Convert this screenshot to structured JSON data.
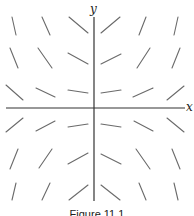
{
  "figure": {
    "caption": "Figure 11.1",
    "x_axis_label": "x",
    "y_axis_label": "y",
    "axis_color": "#333333",
    "segment_color": "#6a6a6a",
    "origin": [
      94,
      108
    ],
    "x_axis": {
      "x1": 6,
      "x2": 185
    },
    "y_axis": {
      "y1": 17,
      "y2": 201
    }
  },
  "chart_data": {
    "type": "direction_field",
    "title": "",
    "xlabel": "x",
    "ylabel": "y",
    "grid": false,
    "caption": "Figure 11.1",
    "grid_points": {
      "x": [
        -3,
        -2,
        -1,
        1,
        2,
        3
      ],
      "y": [
        3,
        2,
        1,
        -1,
        -2,
        -3
      ]
    },
    "segments": [
      {
        "x1": 12,
        "y1": 17,
        "x2": 16,
        "y2": 35
      },
      {
        "x1": 42,
        "y1": 17,
        "x2": 50,
        "y2": 35
      },
      {
        "x1": 69,
        "y1": 17,
        "x2": 88,
        "y2": 33
      },
      {
        "x1": 101,
        "y1": 33,
        "x2": 120,
        "y2": 17
      },
      {
        "x1": 139,
        "y1": 35,
        "x2": 146,
        "y2": 17
      },
      {
        "x1": 174,
        "y1": 35,
        "x2": 178,
        "y2": 17
      },
      {
        "x1": 10,
        "y1": 48,
        "x2": 18,
        "y2": 68
      },
      {
        "x1": 38,
        "y1": 48,
        "x2": 52,
        "y2": 68
      },
      {
        "x1": 68,
        "y1": 53,
        "x2": 88,
        "y2": 64
      },
      {
        "x1": 101,
        "y1": 64,
        "x2": 121,
        "y2": 54
      },
      {
        "x1": 137,
        "y1": 68,
        "x2": 150,
        "y2": 48
      },
      {
        "x1": 172,
        "y1": 68,
        "x2": 180,
        "y2": 48
      },
      {
        "x1": 6,
        "y1": 85,
        "x2": 23,
        "y2": 100
      },
      {
        "x1": 36,
        "y1": 88,
        "x2": 55,
        "y2": 97
      },
      {
        "x1": 68,
        "y1": 90,
        "x2": 88,
        "y2": 93
      },
      {
        "x1": 101,
        "y1": 93,
        "x2": 121,
        "y2": 90
      },
      {
        "x1": 133,
        "y1": 97,
        "x2": 153,
        "y2": 88
      },
      {
        "x1": 167,
        "y1": 100,
        "x2": 184,
        "y2": 86
      },
      {
        "x1": 6,
        "y1": 132,
        "x2": 23,
        "y2": 118
      },
      {
        "x1": 36,
        "y1": 131,
        "x2": 55,
        "y2": 121
      },
      {
        "x1": 68,
        "y1": 127,
        "x2": 88,
        "y2": 124
      },
      {
        "x1": 101,
        "y1": 124,
        "x2": 121,
        "y2": 127
      },
      {
        "x1": 134,
        "y1": 121,
        "x2": 153,
        "y2": 131
      },
      {
        "x1": 167,
        "y1": 118,
        "x2": 184,
        "y2": 132
      },
      {
        "x1": 10,
        "y1": 169,
        "x2": 18,
        "y2": 149
      },
      {
        "x1": 39,
        "y1": 168,
        "x2": 52,
        "y2": 149
      },
      {
        "x1": 68,
        "y1": 164,
        "x2": 88,
        "y2": 153
      },
      {
        "x1": 101,
        "y1": 154,
        "x2": 121,
        "y2": 164
      },
      {
        "x1": 136,
        "y1": 149,
        "x2": 150,
        "y2": 169
      },
      {
        "x1": 172,
        "y1": 149,
        "x2": 180,
        "y2": 169
      },
      {
        "x1": 12,
        "y1": 200,
        "x2": 16,
        "y2": 183
      },
      {
        "x1": 42,
        "y1": 200,
        "x2": 50,
        "y2": 183
      },
      {
        "x1": 69,
        "y1": 200,
        "x2": 88,
        "y2": 185
      },
      {
        "x1": 101,
        "y1": 185,
        "x2": 120,
        "y2": 200
      },
      {
        "x1": 139,
        "y1": 183,
        "x2": 146,
        "y2": 200
      },
      {
        "x1": 174,
        "y1": 183,
        "x2": 178,
        "y2": 200
      }
    ]
  }
}
